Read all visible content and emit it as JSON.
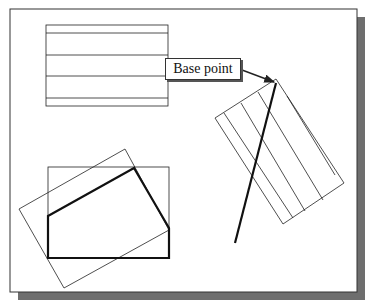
{
  "diagram": {
    "type": "cad-rotate-illustration",
    "annotation": {
      "label": "Base point"
    },
    "colors": {
      "frame_border": "#333333",
      "frame_shadow": "#6e6e6e",
      "line": "#222222",
      "background": "#ffffff"
    },
    "frame": {
      "x": 10,
      "y": 9,
      "width": 347,
      "height": 283,
      "shadow_offset": 8
    },
    "top_rectangle": {
      "x": 46,
      "y": 25,
      "width": 122,
      "height": 81,
      "hatch_lines_y": [
        33,
        55,
        76,
        98
      ]
    },
    "rotated_hatched_rectangle": {
      "corners": [
        [
          215,
          118
        ],
        [
          276,
          79
        ],
        [
          344,
          183
        ],
        [
          283,
          224
        ]
      ],
      "hatch_lines": [
        [
          [
            224,
            113
          ],
          [
            293,
            218
          ]
        ],
        [
          [
            241,
            103
          ],
          [
            305,
            211
          ]
        ],
        [
          [
            258,
            92
          ],
          [
            323,
            200
          ]
        ],
        [
          [
            268,
            86
          ],
          [
            335,
            190
          ]
        ]
      ]
    },
    "thick_line": {
      "from": [
        276,
        83
      ],
      "to": [
        235,
        243
      ]
    },
    "arrow": {
      "from": [
        242,
        70
      ],
      "to": [
        274,
        83
      ]
    },
    "bottom_rectangle": {
      "x": 48,
      "y": 167,
      "width": 121,
      "height": 91
    },
    "bottom_rotated_rectangle": {
      "corners": [
        [
          19,
          209
        ],
        [
          125,
          149
        ],
        [
          169,
          230
        ],
        [
          64,
          288
        ]
      ]
    },
    "thick_polygon": {
      "points": [
        [
          48,
          216
        ],
        [
          134,
          168
        ],
        [
          169,
          228
        ],
        [
          169,
          258
        ],
        [
          48,
          258
        ]
      ]
    }
  }
}
